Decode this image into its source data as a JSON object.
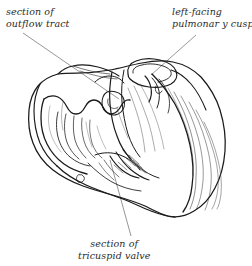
{
  "figure": {
    "kind": "anatomical-line-drawing",
    "background_color": "#ffffff",
    "ink_color": "#1a1a1a",
    "leader_color": "#5a5a5a",
    "text_color": "#2b2b2b"
  },
  "labels": {
    "outflow": {
      "line1": "section of",
      "line2": "outflow tract"
    },
    "pulmonary": {
      "line1": "left-facing",
      "line2": "pulmonar y cusp"
    },
    "tricuspid": {
      "line1": "section of",
      "line2": "tricuspid valve"
    }
  }
}
